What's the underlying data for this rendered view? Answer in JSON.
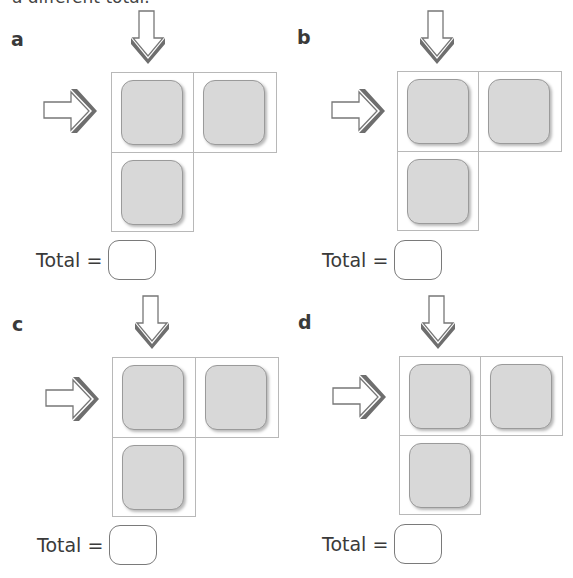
{
  "header": {
    "instruction_fragment": "a different total."
  },
  "panels": [
    {
      "label": "a",
      "total_label": "Total =",
      "total_value": "",
      "tiles": [
        "",
        "",
        ""
      ]
    },
    {
      "label": "b",
      "total_label": "Total =",
      "total_value": "",
      "tiles": [
        "",
        "",
        ""
      ]
    },
    {
      "label": "c",
      "total_label": "Total =",
      "total_value": "",
      "tiles": [
        "",
        "",
        ""
      ]
    },
    {
      "label": "d",
      "total_label": "Total =",
      "total_value": "",
      "tiles": [
        "",
        "",
        ""
      ]
    }
  ],
  "icons": {
    "down_arrow": "down-arrow-icon",
    "right_arrow": "right-arrow-icon"
  },
  "colors": {
    "tile_fill": "#d8d8d8",
    "tile_border": "#9a9a9a",
    "grid_line": "#b8b8b8",
    "arrow_shadow": "#6e6e6e",
    "text": "#3a3a3a"
  }
}
